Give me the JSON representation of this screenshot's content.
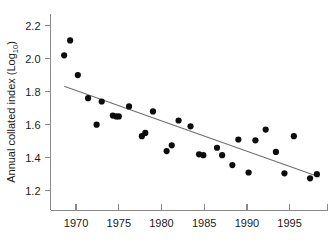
{
  "chart_data": {
    "type": "scatter",
    "title": "",
    "xlabel": "",
    "ylabel": "Annual collated index (Log10)",
    "ylabel_text": "Annual collated index (Log",
    "ylabel_subscript": "10",
    "ylabel_suffix": ")",
    "xlim": [
      1967.0,
      1999.5
    ],
    "ylim": [
      1.08,
      2.27
    ],
    "grid": false,
    "legend": null,
    "xticks": [
      1970,
      1975,
      1980,
      1985,
      1990,
      1995
    ],
    "xtick_labels": [
      "1970",
      "1975",
      "1980",
      "1985",
      "1990",
      "1995"
    ],
    "yticks": [
      1.2,
      1.4,
      1.6,
      1.8,
      2.0,
      2.2
    ],
    "ytick_labels": [
      "1.2",
      "1.4",
      "1.6",
      "1.8",
      "2.0",
      "2.2"
    ],
    "x": [
      1968.6,
      1969.3,
      1970.2,
      1971.4,
      1972.4,
      1973.0,
      1974.3,
      1974.7,
      1975.0,
      1976.2,
      1977.7,
      1978.1,
      1979.0,
      1980.6,
      1981.2,
      1982.0,
      1983.4,
      1984.4,
      1984.9,
      1986.5,
      1987.1,
      1988.3,
      1989.0,
      1990.2,
      1991.0,
      1992.2,
      1993.4,
      1994.4,
      1995.5,
      1997.4,
      1998.2
    ],
    "y": [
      2.02,
      2.11,
      1.9,
      1.76,
      1.6,
      1.74,
      1.655,
      1.65,
      1.65,
      1.71,
      1.53,
      1.55,
      1.68,
      1.44,
      1.475,
      1.625,
      1.59,
      1.42,
      1.415,
      1.46,
      1.415,
      1.355,
      1.51,
      1.31,
      1.505,
      1.57,
      1.435,
      1.305,
      1.53,
      1.275,
      1.3
    ],
    "values": [
      {
        "year": 1968.6,
        "index": 2.02
      },
      {
        "year": 1969.3,
        "index": 2.11
      },
      {
        "year": 1970.2,
        "index": 1.9
      },
      {
        "year": 1971.4,
        "index": 1.76
      },
      {
        "year": 1972.4,
        "index": 1.6
      },
      {
        "year": 1973.0,
        "index": 1.74
      },
      {
        "year": 1974.3,
        "index": 1.655
      },
      {
        "year": 1974.7,
        "index": 1.65
      },
      {
        "year": 1975.0,
        "index": 1.65
      },
      {
        "year": 1976.2,
        "index": 1.71
      },
      {
        "year": 1977.7,
        "index": 1.53
      },
      {
        "year": 1978.1,
        "index": 1.55
      },
      {
        "year": 1979.0,
        "index": 1.68
      },
      {
        "year": 1980.6,
        "index": 1.44
      },
      {
        "year": 1981.2,
        "index": 1.475
      },
      {
        "year": 1982.0,
        "index": 1.625
      },
      {
        "year": 1983.4,
        "index": 1.59
      },
      {
        "year": 1984.4,
        "index": 1.42
      },
      {
        "year": 1984.9,
        "index": 1.415
      },
      {
        "year": 1986.5,
        "index": 1.46
      },
      {
        "year": 1987.1,
        "index": 1.415
      },
      {
        "year": 1988.3,
        "index": 1.355
      },
      {
        "year": 1989.0,
        "index": 1.51
      },
      {
        "year": 1990.2,
        "index": 1.31
      },
      {
        "year": 1991.0,
        "index": 1.505
      },
      {
        "year": 1992.2,
        "index": 1.57
      },
      {
        "year": 1993.4,
        "index": 1.435
      },
      {
        "year": 1994.4,
        "index": 1.305
      },
      {
        "year": 1995.5,
        "index": 1.53
      },
      {
        "year": 1997.4,
        "index": 1.275
      },
      {
        "year": 1998.2,
        "index": 1.3
      }
    ],
    "trend_line": {
      "type": "linear-fit",
      "x_start": 1968.6,
      "y_start": 1.832,
      "x_end": 1998.5,
      "y_end": 1.283
    },
    "marker": {
      "shape": "circle",
      "radius_px": 3.1,
      "color": "#0d0d0d"
    },
    "colors": {
      "marker": "#0d0d0d",
      "trend": "#6f6f6f",
      "axis": "#8a8a8a",
      "text": "#1a1a1a",
      "background": "#ffffff"
    }
  }
}
